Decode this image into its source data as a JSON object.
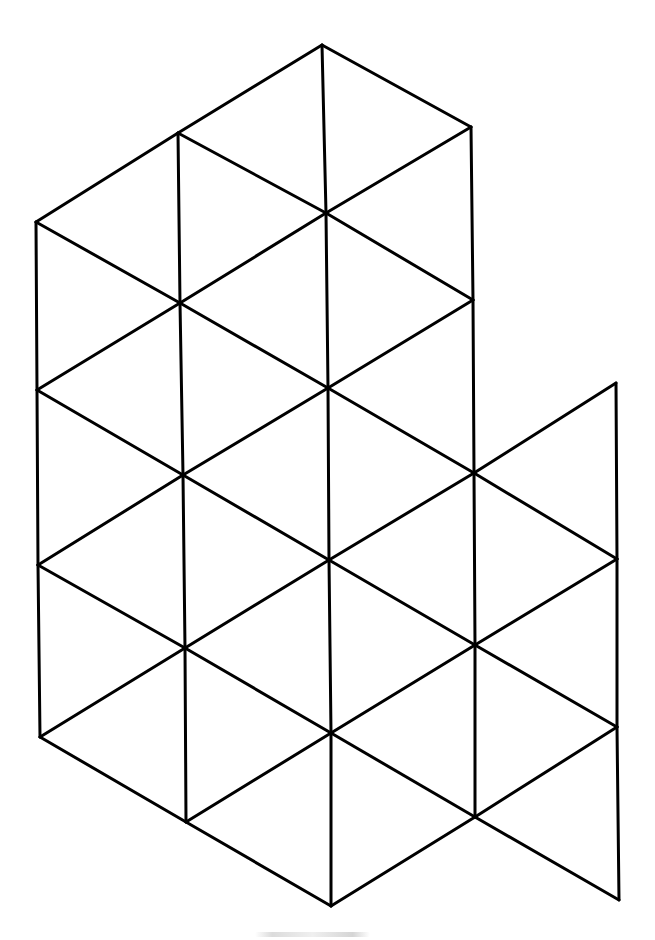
{
  "diagram": {
    "title": "",
    "stroke_color": "#000000",
    "background_color": "#ffffff",
    "nodes": {
      "C0": [
        322,
        45
      ],
      "B0": [
        178,
        133
      ],
      "D0": [
        471,
        127
      ],
      "A0": [
        36,
        222
      ],
      "C1": [
        326,
        213
      ],
      "B1": [
        180,
        303
      ],
      "D1": [
        473,
        300
      ],
      "A1": [
        37,
        390
      ],
      "C2": [
        328,
        388
      ],
      "E0": [
        616,
        383
      ],
      "B2": [
        183,
        475
      ],
      "D2": [
        474,
        473
      ],
      "A2": [
        38,
        565
      ],
      "C3": [
        329,
        560
      ],
      "E1": [
        617,
        559
      ],
      "B3": [
        185,
        648
      ],
      "D3": [
        475,
        645
      ],
      "A3": [
        40,
        737
      ],
      "C4": [
        331,
        733
      ],
      "E2": [
        617,
        727
      ],
      "B4": [
        186,
        822
      ],
      "D4": [
        475,
        817
      ],
      "C5": [
        331,
        906
      ],
      "E3": [
        619,
        900
      ]
    },
    "edges": [
      [
        "C0",
        "B0"
      ],
      [
        "C0",
        "D0"
      ],
      [
        "B0",
        "A0"
      ],
      [
        "C0",
        "C1"
      ],
      [
        "B0",
        "C1"
      ],
      [
        "D0",
        "C1"
      ],
      [
        "B0",
        "B1"
      ],
      [
        "D0",
        "D1"
      ],
      [
        "A0",
        "B1"
      ],
      [
        "C1",
        "B1"
      ],
      [
        "C1",
        "D1"
      ],
      [
        "A0",
        "A1"
      ],
      [
        "A1",
        "A2"
      ],
      [
        "A2",
        "A3"
      ],
      [
        "B1",
        "B2"
      ],
      [
        "B2",
        "B3"
      ],
      [
        "B3",
        "B4"
      ],
      [
        "C1",
        "C2"
      ],
      [
        "C2",
        "C3"
      ],
      [
        "C3",
        "C4"
      ],
      [
        "C4",
        "C5"
      ],
      [
        "D1",
        "D2"
      ],
      [
        "D2",
        "D3"
      ],
      [
        "D3",
        "D4"
      ],
      [
        "E0",
        "E1"
      ],
      [
        "E1",
        "E2"
      ],
      [
        "E2",
        "E3"
      ],
      [
        "B1",
        "A1"
      ],
      [
        "B1",
        "C2"
      ],
      [
        "D1",
        "C2"
      ],
      [
        "A1",
        "B2"
      ],
      [
        "C2",
        "B2"
      ],
      [
        "C2",
        "D2"
      ],
      [
        "E0",
        "D2"
      ],
      [
        "B2",
        "A2"
      ],
      [
        "B2",
        "C3"
      ],
      [
        "D2",
        "C3"
      ],
      [
        "D2",
        "E1"
      ],
      [
        "A2",
        "B3"
      ],
      [
        "C3",
        "B3"
      ],
      [
        "C3",
        "D3"
      ],
      [
        "E1",
        "D3"
      ],
      [
        "B3",
        "A3"
      ],
      [
        "B3",
        "C4"
      ],
      [
        "D3",
        "C4"
      ],
      [
        "D3",
        "E2"
      ],
      [
        "A3",
        "B4"
      ],
      [
        "C4",
        "B4"
      ],
      [
        "C4",
        "D4"
      ],
      [
        "E2",
        "D4"
      ],
      [
        "B4",
        "C5"
      ],
      [
        "D4",
        "C5"
      ],
      [
        "D4",
        "E3"
      ]
    ]
  },
  "caption": {
    "text": "",
    "note": "faint illegible caption text beneath the drawing"
  }
}
